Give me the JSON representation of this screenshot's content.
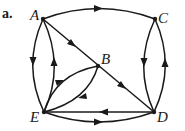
{
  "figure": {
    "tag": "a.",
    "nodes": [
      {
        "id": "A",
        "label": "A"
      },
      {
        "id": "B",
        "label": "B"
      },
      {
        "id": "C",
        "label": "C"
      },
      {
        "id": "D",
        "label": "D"
      },
      {
        "id": "E",
        "label": "E"
      }
    ],
    "edges": [
      {
        "from": "A",
        "to": "C"
      },
      {
        "from": "A",
        "to": "B"
      },
      {
        "from": "B",
        "to": "D"
      },
      {
        "from": "A",
        "to": "E"
      },
      {
        "from": "E",
        "to": "A"
      },
      {
        "from": "C",
        "to": "D"
      },
      {
        "from": "D",
        "to": "C"
      },
      {
        "from": "E",
        "to": "B"
      },
      {
        "from": "B",
        "to": "E"
      },
      {
        "from": "D",
        "to": "E"
      },
      {
        "from": "E",
        "to": "D"
      }
    ]
  }
}
